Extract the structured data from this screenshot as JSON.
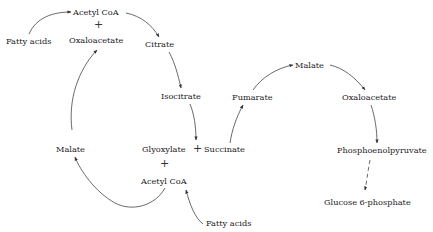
{
  "diagram": {
    "nodes": {
      "fatty_acids_top": "Fatty acids",
      "acetyl_coa_top": "Acetyl CoA",
      "plus_top": "+",
      "oxaloacetate_top": "Oxaloacetate",
      "citrate": "Citrate",
      "isocitrate": "Isocitrate",
      "malate_left": "Malate",
      "glyoxylate": "Glyoxylate",
      "plus_middle": "+",
      "succinate": "Succinate",
      "plus_bottom": "+",
      "acetyl_coa_bottom": "Acetyl CoA",
      "fatty_acids_bottom": "Fatty acids",
      "fumarate": "Fumarate",
      "malate_right": "Malate",
      "oxaloacetate_right": "Oxaloacetate",
      "phosphoenolpyruvate": "Phosphoenolpyruvate",
      "glucose_6_phosphate": "Glucose 6-phosphate"
    },
    "colors": {
      "text": "#222222",
      "arrow": "#333333",
      "background": "#ffffff"
    }
  }
}
